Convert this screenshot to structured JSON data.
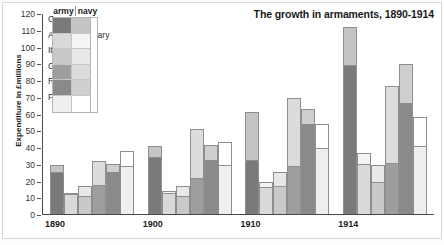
{
  "chart_data": {
    "type": "bar",
    "subtype": "stacked-grouped",
    "title": "The growth in armaments, 1890-1914",
    "xlabel": "",
    "ylabel": "Expenditure in £millions",
    "ylim": [
      0,
      120
    ],
    "ytick_step": 10,
    "yticks": [
      0,
      10,
      20,
      30,
      40,
      50,
      60,
      70,
      80,
      90,
      100,
      110,
      120
    ],
    "grid": false,
    "legend_position": "top-left",
    "legend_columns": [
      "army",
      "navy"
    ],
    "categories": [
      "1890",
      "1900",
      "1910",
      "1914"
    ],
    "countries": [
      "Germany",
      "Austria-Hungary",
      "Italy",
      "Great Britain",
      "Russia",
      "France"
    ],
    "series": [
      {
        "name": "Germany",
        "army_color": "#7a7a7a",
        "navy_color": "#c4c4c4",
        "army": [
          25,
          34,
          32.5,
          89
        ],
        "navy": [
          4,
          6.5,
          28.5,
          22.5
        ],
        "totals": [
          29,
          40.5,
          61,
          111.5
        ]
      },
      {
        "name": "Austria-Hungary",
        "army_color": "#d9d9d9",
        "navy_color": "#f4f4f4",
        "army": [
          12,
          12.5,
          16,
          30
        ],
        "navy": [
          0.5,
          1.5,
          3,
          6.5
        ],
        "totals": [
          12.5,
          14,
          19,
          36.5
        ]
      },
      {
        "name": "Italy",
        "army_color": "#c9c9c9",
        "navy_color": "#e8e8e8",
        "army": [
          11,
          11,
          17,
          19
        ],
        "navy": [
          5.5,
          5.5,
          8,
          10.5
        ],
        "totals": [
          16.5,
          16.5,
          25,
          29.5
        ]
      },
      {
        "name": "Great Britain",
        "army_color": "#9e9e9e",
        "navy_color": "#dcdcdc",
        "army": [
          17.5,
          21.5,
          28.5,
          30.5
        ],
        "navy": [
          14,
          29.5,
          40.5,
          46
        ],
        "totals": [
          31.5,
          51,
          69,
          76.5
        ]
      },
      {
        "name": "Russia",
        "army_color": "#8a8a8a",
        "navy_color": "#cfcfcf",
        "army": [
          25,
          32.5,
          53.5,
          66
        ],
        "navy": [
          5,
          8.5,
          9,
          23.5
        ],
        "totals": [
          30,
          41,
          62.5,
          89.5
        ]
      },
      {
        "name": "France",
        "army_color": "#efefef",
        "navy_color": "#ffffff",
        "army": [
          28.5,
          29,
          39.5,
          40.5
        ],
        "navy": [
          9,
          14,
          14.5,
          17.5
        ],
        "totals": [
          37.5,
          43,
          54,
          58
        ]
      }
    ]
  }
}
